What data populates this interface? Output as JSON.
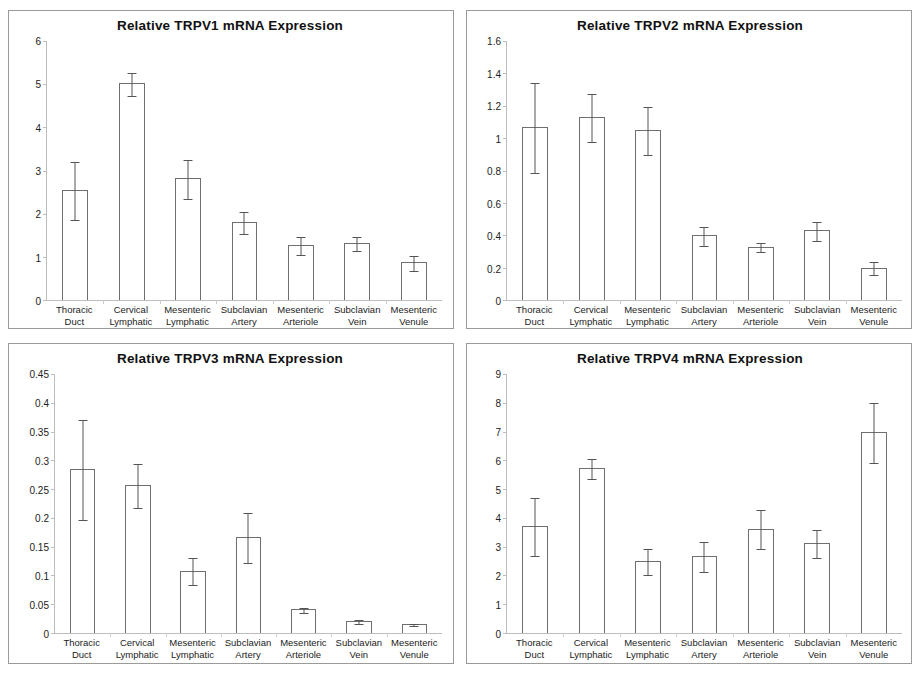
{
  "figure": {
    "categories": [
      [
        "Thoracic",
        "Duct"
      ],
      [
        "Cervical",
        "Lymphatic"
      ],
      [
        "Mesenteric",
        "Lymphatic"
      ],
      [
        "Subclavian",
        "Artery"
      ],
      [
        "Mesenteric",
        "Arteriole"
      ],
      [
        "Subclavian",
        "Vein"
      ],
      [
        "Mesenteric",
        "Venule"
      ]
    ]
  },
  "chart_data": [
    {
      "type": "bar",
      "panel": "top-left",
      "title": "Relative TRPV1 mRNA Expression",
      "xlabel": "",
      "ylabel": "",
      "ylim": [
        0,
        6
      ],
      "yticks": [
        0,
        1,
        2,
        3,
        4,
        5,
        6
      ],
      "ytick_labels": [
        "0",
        "1",
        "2",
        "3",
        "4",
        "5",
        "6"
      ],
      "grid": false,
      "legend": "none",
      "categories": [
        "Thoracic Duct",
        "Cervical Lymphatic",
        "Mesenteric Lymphatic",
        "Subclavian Artery",
        "Mesenteric Arteriole",
        "Subclavian Vein",
        "Mesenteric Venule"
      ],
      "values": [
        2.55,
        5.02,
        2.82,
        1.8,
        1.27,
        1.32,
        0.87
      ],
      "errors": [
        0.68,
        0.27,
        0.45,
        0.26,
        0.21,
        0.17,
        0.17
      ]
    },
    {
      "type": "bar",
      "panel": "top-right",
      "title": "Relative TRPV2 mRNA Expression",
      "xlabel": "",
      "ylabel": "",
      "ylim": [
        0,
        1.6
      ],
      "yticks": [
        0,
        0.2,
        0.4,
        0.6,
        0.8,
        1,
        1.2,
        1.4,
        1.6
      ],
      "ytick_labels": [
        "0",
        "0.2",
        "0.4",
        "0.6",
        "0.8",
        "1",
        "1.2",
        "1.4",
        "1.6"
      ],
      "grid": false,
      "legend": "none",
      "categories": [
        "Thoracic Duct",
        "Cervical Lymphatic",
        "Mesenteric Lymphatic",
        "Subclavian Artery",
        "Mesenteric Arteriole",
        "Subclavian Vein",
        "Mesenteric Venule"
      ],
      "values": [
        1.07,
        1.13,
        1.05,
        0.4,
        0.33,
        0.43,
        0.2
      ],
      "errors": [
        0.28,
        0.15,
        0.15,
        0.06,
        0.03,
        0.06,
        0.04
      ]
    },
    {
      "type": "bar",
      "panel": "bottom-left",
      "title": "Relative TRPV3 mRNA Expression",
      "xlabel": "",
      "ylabel": "",
      "ylim": [
        0,
        0.45
      ],
      "yticks": [
        0,
        0.05,
        0.1,
        0.15,
        0.2,
        0.25,
        0.3,
        0.35,
        0.4,
        0.45
      ],
      "ytick_labels": [
        "0",
        "0.05",
        "0.1",
        "0.15",
        "0.2",
        "0.25",
        "0.3",
        "0.35",
        "0.4",
        "0.45"
      ],
      "grid": false,
      "legend": "none",
      "categories": [
        "Thoracic Duct",
        "Cervical Lymphatic",
        "Mesenteric Lymphatic",
        "Subclavian Artery",
        "Mesenteric Arteriole",
        "Subclavian Vein",
        "Mesenteric Venule"
      ],
      "values": [
        0.285,
        0.257,
        0.108,
        0.167,
        0.041,
        0.021,
        0.016
      ],
      "errors": [
        0.087,
        0.038,
        0.024,
        0.044,
        0.004,
        0.004,
        0.002
      ]
    },
    {
      "type": "bar",
      "panel": "bottom-right",
      "title": "Relative TRPV4 mRNA Expression",
      "xlabel": "",
      "ylabel": "",
      "ylim": [
        0,
        9
      ],
      "yticks": [
        0,
        1,
        2,
        3,
        4,
        5,
        6,
        7,
        8,
        9
      ],
      "ytick_labels": [
        "0",
        "1",
        "2",
        "3",
        "4",
        "5",
        "6",
        "7",
        "8",
        "9"
      ],
      "grid": false,
      "legend": "none",
      "categories": [
        "Thoracic Duct",
        "Cervical Lymphatic",
        "Mesenteric Lymphatic",
        "Subclavian Artery",
        "Mesenteric Arteriole",
        "Subclavian Vein",
        "Mesenteric Venule"
      ],
      "values": [
        3.72,
        5.75,
        2.5,
        2.68,
        3.63,
        3.13,
        6.97
      ],
      "errors": [
        1.03,
        0.35,
        0.47,
        0.53,
        0.68,
        0.48,
        1.05
      ]
    }
  ]
}
